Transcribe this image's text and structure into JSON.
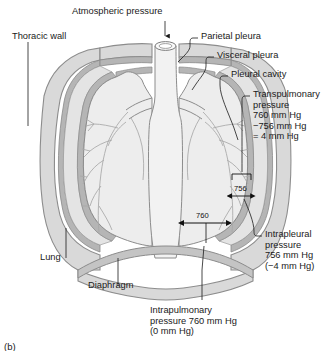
{
  "figure": {
    "caption": "(b)",
    "labels": {
      "atmospheric_pressure": "Atmospheric pressure",
      "thoracic_wall": "Thoracic wall",
      "parietal_pleura": "Parietal pleura",
      "visceral_pleura": "Visceral pleura",
      "pleural_cavity": "Pleural cavity",
      "lung": "Lung",
      "diaphragm": "Diaphragm",
      "transpulmonary_pressure": "Transpulmonary\npressure\n760 mm Hg\n−756 mm Hg\n= 4 mm Hg",
      "intrapleural_pressure": "Intrapleural\npressure\n756 mm Hg\n(−4 mm Hg)",
      "intrapulmonary_pressure": "Intrapulmonary\npressure 760 mm Hg\n(0 mm Hg)"
    },
    "measurements": {
      "intrapulmonary_value": "760",
      "intrapleural_value": "756"
    },
    "colors": {
      "outline": "#8c8c8c",
      "wall_fill": "#d9d9d9",
      "pleura_band": "#b5b5b5",
      "lung_fill": "#ededed",
      "cavity_fill": "#e4e4e4",
      "text": "#1a1a1a"
    }
  }
}
